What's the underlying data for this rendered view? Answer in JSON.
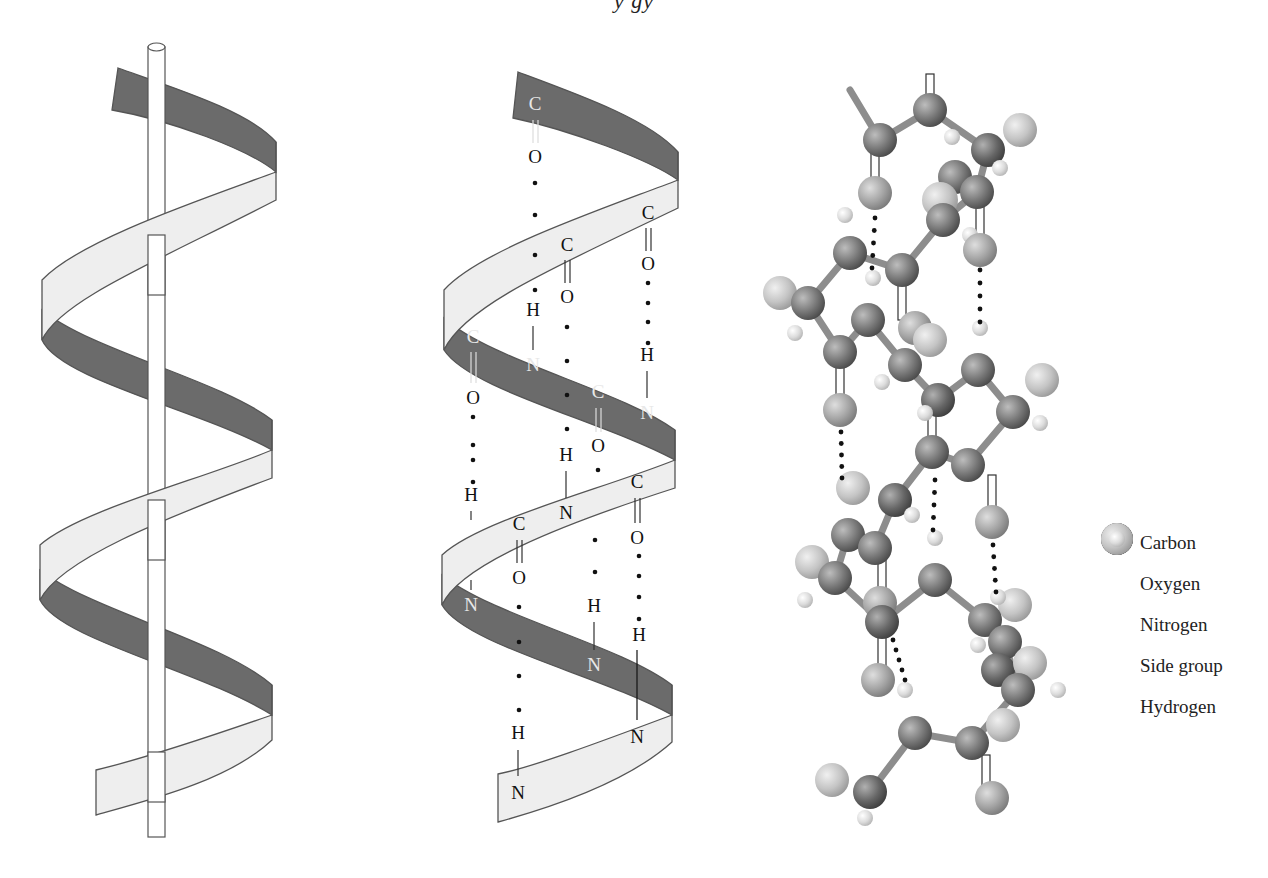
{
  "figure": {
    "title_fragment": "y    gy",
    "panels": [
      {
        "id": "ribbon-with-axis",
        "description": "Alpha helix ribbon wrapped around a central rod"
      },
      {
        "id": "ribbon-with-hbonds",
        "description": "Alpha helix ribbon showing C=O···H-N hydrogen bonds"
      },
      {
        "id": "ball-and-stick",
        "description": "Ball-and-stick model of alpha helix"
      }
    ],
    "colors": {
      "ribbon_front": "#eeeeee",
      "ribbon_back": "#6b6b6b",
      "outline": "#555555",
      "carbon": "#7a7a7a",
      "oxygen": "#a8a8a8",
      "nitrogen": "#686868",
      "side_group": "#c4c4c4",
      "hydrogen": "#dcdcdc"
    }
  },
  "hbond_labels": [
    {
      "t": "C",
      "x": 535,
      "y": 110,
      "back": true
    },
    {
      "t": "O",
      "x": 535,
      "y": 163
    },
    {
      "t": "C",
      "x": 648,
      "y": 219
    },
    {
      "t": "C",
      "x": 567,
      "y": 251
    },
    {
      "t": "O",
      "x": 648,
      "y": 270
    },
    {
      "t": "H",
      "x": 533,
      "y": 316
    },
    {
      "t": "O",
      "x": 567,
      "y": 303
    },
    {
      "t": "C",
      "x": 473,
      "y": 343,
      "back": true
    },
    {
      "t": "N",
      "x": 533,
      "y": 371,
      "back": true
    },
    {
      "t": "H",
      "x": 647,
      "y": 361
    },
    {
      "t": "O",
      "x": 473,
      "y": 404
    },
    {
      "t": "C",
      "x": 598,
      "y": 398,
      "back": true
    },
    {
      "t": "N",
      "x": 647,
      "y": 419,
      "back": true
    },
    {
      "t": "O",
      "x": 598,
      "y": 452
    },
    {
      "t": "H",
      "x": 566,
      "y": 461
    },
    {
      "t": "H",
      "x": 471,
      "y": 501
    },
    {
      "t": "C",
      "x": 637,
      "y": 488
    },
    {
      "t": "N",
      "x": 566,
      "y": 519
    },
    {
      "t": "C",
      "x": 519,
      "y": 530
    },
    {
      "t": "O",
      "x": 637,
      "y": 544
    },
    {
      "t": "O",
      "x": 519,
      "y": 584
    },
    {
      "t": "N",
      "x": 471,
      "y": 611,
      "back": true
    },
    {
      "t": "H",
      "x": 594,
      "y": 612
    },
    {
      "t": "H",
      "x": 639,
      "y": 641
    },
    {
      "t": "N",
      "x": 594,
      "y": 671,
      "back": true
    },
    {
      "t": "H",
      "x": 518,
      "y": 739
    },
    {
      "t": "N",
      "x": 637,
      "y": 743
    },
    {
      "t": "N",
      "x": 518,
      "y": 799
    }
  ],
  "legend": {
    "items": [
      {
        "label": "Carbon",
        "color": "#6e6e6e",
        "size": 34
      },
      {
        "label": "Oxygen",
        "color": "#a6a6a6",
        "size": 34
      },
      {
        "label": "Nitrogen",
        "color": "#5f5f5f",
        "size": 34
      },
      {
        "label": "Side group",
        "color": "#c2c2c2",
        "size": 34
      },
      {
        "label": "Hydrogen",
        "color": "#dedede",
        "size": 18
      }
    ]
  },
  "atoms": [
    {
      "x": 930,
      "y": 110,
      "r": 17,
      "k": "carbon"
    },
    {
      "x": 880,
      "y": 140,
      "r": 17,
      "k": "carbon"
    },
    {
      "x": 988,
      "y": 150,
      "r": 17,
      "k": "nitrogen"
    },
    {
      "x": 1020,
      "y": 130,
      "r": 17,
      "k": "side_group"
    },
    {
      "x": 952,
      "y": 137,
      "r": 8,
      "k": "hydrogen"
    },
    {
      "x": 1000,
      "y": 168,
      "r": 8,
      "k": "hydrogen"
    },
    {
      "x": 875,
      "y": 193,
      "r": 17,
      "k": "oxygen"
    },
    {
      "x": 955,
      "y": 177,
      "r": 17,
      "k": "carbon"
    },
    {
      "x": 977,
      "y": 192,
      "r": 17,
      "k": "carbon"
    },
    {
      "x": 940,
      "y": 200,
      "r": 18,
      "k": "side_group"
    },
    {
      "x": 943,
      "y": 220,
      "r": 17,
      "k": "carbon"
    },
    {
      "x": 970,
      "y": 235,
      "r": 8,
      "k": "hydrogen"
    },
    {
      "x": 980,
      "y": 250,
      "r": 17,
      "k": "oxygen"
    },
    {
      "x": 845,
      "y": 215,
      "r": 8,
      "k": "hydrogen"
    },
    {
      "x": 850,
      "y": 253,
      "r": 17,
      "k": "carbon"
    },
    {
      "x": 902,
      "y": 270,
      "r": 17,
      "k": "carbon"
    },
    {
      "x": 873,
      "y": 278,
      "r": 8,
      "k": "hydrogen"
    },
    {
      "x": 980,
      "y": 328,
      "r": 8,
      "k": "hydrogen"
    },
    {
      "x": 780,
      "y": 293,
      "r": 17,
      "k": "side_group"
    },
    {
      "x": 808,
      "y": 303,
      "r": 17,
      "k": "carbon"
    },
    {
      "x": 868,
      "y": 320,
      "r": 17,
      "k": "carbon"
    },
    {
      "x": 915,
      "y": 328,
      "r": 17,
      "k": "oxygen"
    },
    {
      "x": 930,
      "y": 340,
      "r": 17,
      "k": "side_group"
    },
    {
      "x": 795,
      "y": 333,
      "r": 8,
      "k": "hydrogen"
    },
    {
      "x": 840,
      "y": 352,
      "r": 17,
      "k": "carbon"
    },
    {
      "x": 905,
      "y": 365,
      "r": 17,
      "k": "carbon"
    },
    {
      "x": 978,
      "y": 370,
      "r": 17,
      "k": "carbon"
    },
    {
      "x": 1042,
      "y": 380,
      "r": 17,
      "k": "side_group"
    },
    {
      "x": 882,
      "y": 382,
      "r": 8,
      "k": "hydrogen"
    },
    {
      "x": 938,
      "y": 400,
      "r": 17,
      "k": "nitrogen"
    },
    {
      "x": 1013,
      "y": 412,
      "r": 17,
      "k": "carbon"
    },
    {
      "x": 925,
      "y": 413,
      "r": 8,
      "k": "hydrogen"
    },
    {
      "x": 1040,
      "y": 423,
      "r": 8,
      "k": "hydrogen"
    },
    {
      "x": 840,
      "y": 410,
      "r": 17,
      "k": "oxygen"
    },
    {
      "x": 932,
      "y": 452,
      "r": 17,
      "k": "carbon"
    },
    {
      "x": 968,
      "y": 465,
      "r": 17,
      "k": "carbon"
    },
    {
      "x": 853,
      "y": 488,
      "r": 17,
      "k": "side_group"
    },
    {
      "x": 895,
      "y": 500,
      "r": 17,
      "k": "nitrogen"
    },
    {
      "x": 912,
      "y": 515,
      "r": 8,
      "k": "hydrogen"
    },
    {
      "x": 992,
      "y": 522,
      "r": 17,
      "k": "oxygen"
    },
    {
      "x": 935,
      "y": 538,
      "r": 8,
      "k": "hydrogen"
    },
    {
      "x": 848,
      "y": 535,
      "r": 17,
      "k": "carbon"
    },
    {
      "x": 875,
      "y": 548,
      "r": 17,
      "k": "carbon"
    },
    {
      "x": 935,
      "y": 580,
      "r": 17,
      "k": "carbon"
    },
    {
      "x": 812,
      "y": 562,
      "r": 17,
      "k": "side_group"
    },
    {
      "x": 835,
      "y": 578,
      "r": 17,
      "k": "carbon"
    },
    {
      "x": 805,
      "y": 600,
      "r": 8,
      "k": "hydrogen"
    },
    {
      "x": 880,
      "y": 603,
      "r": 17,
      "k": "oxygen"
    },
    {
      "x": 882,
      "y": 622,
      "r": 17,
      "k": "nitrogen"
    },
    {
      "x": 1015,
      "y": 605,
      "r": 17,
      "k": "side_group"
    },
    {
      "x": 985,
      "y": 620,
      "r": 17,
      "k": "carbon"
    },
    {
      "x": 998,
      "y": 597,
      "r": 8,
      "k": "hydrogen"
    },
    {
      "x": 978,
      "y": 645,
      "r": 8,
      "k": "hydrogen"
    },
    {
      "x": 1005,
      "y": 642,
      "r": 17,
      "k": "carbon"
    },
    {
      "x": 998,
      "y": 670,
      "r": 17,
      "k": "nitrogen"
    },
    {
      "x": 1030,
      "y": 663,
      "r": 17,
      "k": "side_group"
    },
    {
      "x": 1018,
      "y": 690,
      "r": 17,
      "k": "carbon"
    },
    {
      "x": 1058,
      "y": 690,
      "r": 8,
      "k": "hydrogen"
    },
    {
      "x": 878,
      "y": 680,
      "r": 17,
      "k": "oxygen"
    },
    {
      "x": 905,
      "y": 690,
      "r": 8,
      "k": "hydrogen"
    },
    {
      "x": 1003,
      "y": 725,
      "r": 17,
      "k": "side_group"
    },
    {
      "x": 915,
      "y": 733,
      "r": 17,
      "k": "carbon"
    },
    {
      "x": 972,
      "y": 743,
      "r": 17,
      "k": "carbon"
    },
    {
      "x": 832,
      "y": 780,
      "r": 17,
      "k": "side_group"
    },
    {
      "x": 870,
      "y": 792,
      "r": 17,
      "k": "nitrogen"
    },
    {
      "x": 865,
      "y": 818,
      "r": 8,
      "k": "hydrogen"
    },
    {
      "x": 992,
      "y": 798,
      "r": 17,
      "k": "oxygen"
    }
  ],
  "hbond_dots_ball": [
    {
      "x1": 875,
      "y1": 218,
      "x2": 872,
      "y2": 268
    },
    {
      "x1": 980,
      "y1": 270,
      "x2": 980,
      "y2": 322
    },
    {
      "x1": 841,
      "y1": 432,
      "x2": 842,
      "y2": 478
    },
    {
      "x1": 935,
      "y1": 480,
      "x2": 933,
      "y2": 530
    },
    {
      "x1": 993,
      "y1": 545,
      "x2": 996,
      "y2": 592
    },
    {
      "x1": 893,
      "y1": 640,
      "x2": 905,
      "y2": 680
    }
  ]
}
